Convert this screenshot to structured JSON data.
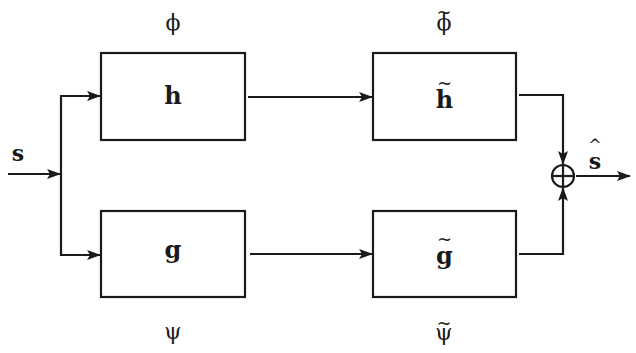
{
  "diagram": {
    "type": "block-diagram",
    "input": {
      "label": "s"
    },
    "output": {
      "label": "ŝ",
      "base": "s",
      "accent": "^"
    },
    "blocks": [
      {
        "id": "h",
        "label": "h",
        "above": "ϕ",
        "position": "top-left"
      },
      {
        "id": "h_tilde",
        "label": "h",
        "tilde": "~",
        "above": "ϕ",
        "above_tilde": "~",
        "position": "top-right"
      },
      {
        "id": "g",
        "label": "g",
        "below": "ψ",
        "position": "bottom-left"
      },
      {
        "id": "g_tilde",
        "label": "g",
        "tilde": "~",
        "below": "ψ",
        "below_tilde": "~",
        "position": "bottom-right"
      }
    ],
    "junction": {
      "symbol": "⊕",
      "type": "summation"
    },
    "edges": [
      {
        "from": "s",
        "to": "split"
      },
      {
        "from": "split",
        "to": "h"
      },
      {
        "from": "split",
        "to": "g"
      },
      {
        "from": "h",
        "to": "h_tilde"
      },
      {
        "from": "g",
        "to": "g_tilde"
      },
      {
        "from": "h_tilde",
        "to": "sum"
      },
      {
        "from": "g_tilde",
        "to": "sum"
      },
      {
        "from": "sum",
        "to": "ŝ"
      }
    ],
    "colors": {
      "stroke": "#1a1a1a",
      "background": "#ffffff"
    }
  }
}
